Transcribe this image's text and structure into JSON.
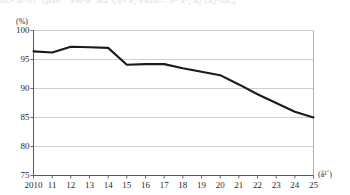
{
  "top_clipped_text": "â€» å›³è¡¨  çµ±è¨ˆ  å‰²åˆ   æŽ¨ç§»   è¦‹é€šã—   å¹´åº¦   ãƒ‡ãƒ¼ã‚¿",
  "chart_data": {
    "type": "line",
    "title": "",
    "xlabel": "(å¹´)",
    "ylabel": "(%)",
    "ylim": [
      75,
      100
    ],
    "ytick_labels": [
      "100",
      "95",
      "90",
      "85",
      "80",
      "75"
    ],
    "ytick_values": [
      100,
      95,
      90,
      85,
      80,
      75
    ],
    "grid": true,
    "grid_axis": "y",
    "legend": "none",
    "categories": [
      "2010",
      "11",
      "12",
      "13",
      "14",
      "15",
      "16",
      "17",
      "18",
      "19",
      "20",
      "21",
      "22",
      "23",
      "24",
      "25"
    ],
    "x_values": [
      2010,
      2011,
      2012,
      2013,
      2014,
      2015,
      2016,
      2017,
      2018,
      2019,
      2020,
      2021,
      2022,
      2023,
      2024,
      2025
    ],
    "series": [
      {
        "name": "",
        "color": "#1a1a1a",
        "values": [
          96.4,
          96.2,
          97.2,
          97.1,
          97.0,
          94.1,
          94.2,
          94.2,
          93.5,
          92.9,
          92.3,
          90.7,
          89.0,
          87.5,
          86.0,
          85.0
        ]
      }
    ]
  }
}
